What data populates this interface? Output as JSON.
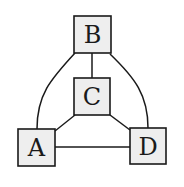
{
  "diagram": {
    "type": "graph",
    "nodes": [
      {
        "id": "B",
        "label": "B"
      },
      {
        "id": "C",
        "label": "C"
      },
      {
        "id": "A",
        "label": "A"
      },
      {
        "id": "D",
        "label": "D"
      }
    ],
    "edges": [
      [
        "B",
        "C"
      ],
      [
        "B",
        "A"
      ],
      [
        "B",
        "D"
      ],
      [
        "C",
        "A"
      ],
      [
        "C",
        "D"
      ],
      [
        "A",
        "D"
      ]
    ],
    "colors": {
      "node_fill": "#eeeeee",
      "stroke": "#1a1a1a"
    }
  }
}
